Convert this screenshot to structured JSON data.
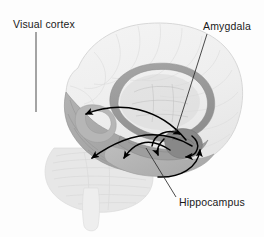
{
  "figure": {
    "background_color": "#fdfdfd",
    "width": 264,
    "height": 237
  },
  "labels": {
    "visual_cortex": "Visual cortex",
    "amygdala": "Amygdala",
    "hippocampus": "Hippocampus"
  },
  "regions": {
    "cortex_outline": {
      "name": "cerebral-cortex",
      "color": "#f0f0f0",
      "stroke": "#d8d8d8"
    },
    "visual_cortex_region": {
      "name": "visual-cortex-region",
      "color": "#a8a8a8"
    },
    "temporal_lobe_region": {
      "name": "temporal-lobe-region",
      "color": "#b4b4b4"
    },
    "corpus_callosum": {
      "name": "corpus-callosum",
      "color": "#9a9a9a"
    },
    "limbic_ring": {
      "name": "limbic-ring",
      "color": "#b0b0b0"
    },
    "cerebellum": {
      "name": "cerebellum",
      "color": "#e4e4e4"
    },
    "brainstem": {
      "name": "brainstem",
      "color": "#ececec"
    },
    "amygdala_region": {
      "name": "amygdala-region",
      "color": "#8e8e8e"
    },
    "hippocampus_region": {
      "name": "hippocampus-region",
      "color": "#9e9e9e"
    }
  },
  "pathways": {
    "arrow_color": "#000000",
    "count": 6,
    "description": "Curved projection arrows between amygdala, hippocampus, temporal lobe and visual cortex"
  },
  "leader_lines": {
    "color": "#2a2a2a",
    "visual_cortex": {
      "x1": 36,
      "y1": 32,
      "x2": 36,
      "y2": 112
    },
    "amygdala": {
      "x1": 207,
      "y1": 34,
      "x2": 176,
      "y2": 132
    },
    "hippocampus": {
      "x1": 146,
      "y1": 148,
      "x2": 176,
      "y2": 197
    }
  }
}
